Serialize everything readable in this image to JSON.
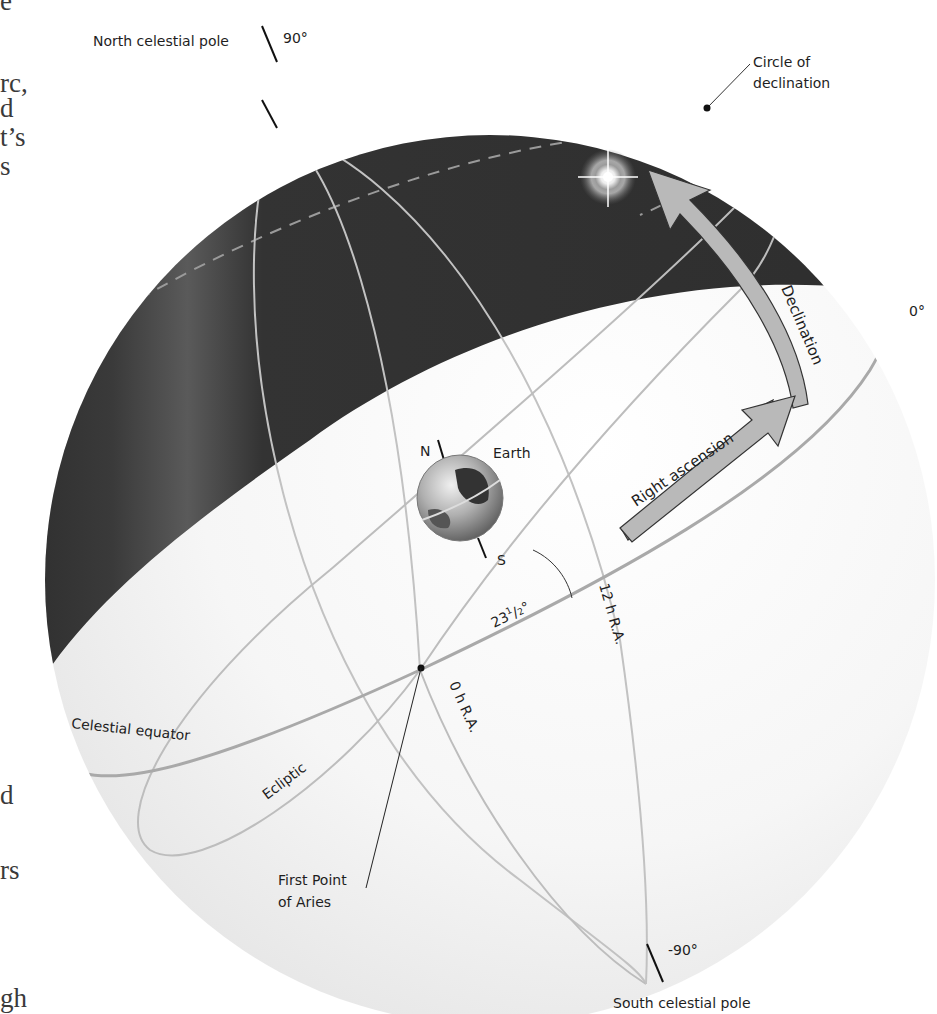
{
  "figure": {
    "colors": {
      "night_sky": "#2e2e2e",
      "sphere_light": "#f4f4f4",
      "grid_line": "#bdbdbd",
      "arrow_fill": "#b9b9b9",
      "text": "#1e1e1e"
    },
    "labels": {
      "north_pole": "North celestial pole",
      "north_angle": "90°",
      "south_pole": "South celestial pole",
      "south_angle": "-90°",
      "circle_of_declination_1": "Circle of",
      "circle_of_declination_2": "declination",
      "equator_angle": "0°",
      "declination": "Declination",
      "right_ascension": "Right ascension",
      "earth": "Earth",
      "earth_north": "N",
      "earth_south": "S",
      "tilt": "23½°",
      "tilt_whole": "23",
      "tilt_num": "1",
      "tilt_den": "2",
      "tilt_deg": "°",
      "ra_12": "12 h R.A.",
      "ra_0": "0 h R.A.",
      "celestial_equator": "Celestial equator",
      "ecliptic": "Ecliptic",
      "first_point_1": "First Point",
      "first_point_2": "of Aries"
    },
    "icons": {
      "star": "star-glow-icon",
      "earth": "earth-globe-icon"
    }
  },
  "page_fragments": [
    {
      "text": "e",
      "x": 0,
      "y": -12
    },
    {
      "text": "rc,",
      "x": 0,
      "y": 78
    },
    {
      "text": "d",
      "x": 0,
      "y": 100
    },
    {
      "text": "t’s",
      "x": 0,
      "y": 124
    },
    {
      "text": "s",
      "x": 0,
      "y": 150
    },
    {
      "text": "d",
      "x": 0,
      "y": 783
    },
    {
      "text": "rs",
      "x": 0,
      "y": 858
    },
    {
      "text": "gh",
      "x": 0,
      "y": 983
    }
  ]
}
